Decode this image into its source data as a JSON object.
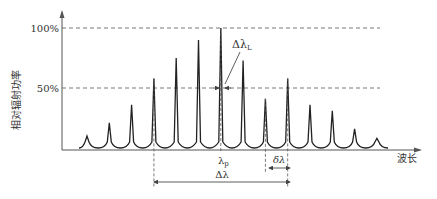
{
  "chart_data": {
    "type": "line",
    "title": "",
    "ylabel": "相对辐射功率",
    "xlabel": "波长",
    "ylim": [
      0,
      100
    ],
    "yticks": [
      "100%",
      "50%"
    ],
    "ytick_values": [
      100,
      50
    ],
    "peaks": [
      10,
      21,
      36,
      58,
      75,
      90,
      100,
      73,
      41,
      58,
      36,
      31,
      16,
      8
    ],
    "center_peak_index": 6,
    "annotations": {
      "linewidth": "Δλ",
      "linewidth_sub": "L",
      "peak_wavelength": "λ",
      "peak_wavelength_sub": "p",
      "mode_spacing": "δλ",
      "spectral_width": "Δλ"
    },
    "spectral_width_range_indices": [
      3,
      9
    ],
    "mode_spacing_indices": [
      8,
      9
    ]
  }
}
